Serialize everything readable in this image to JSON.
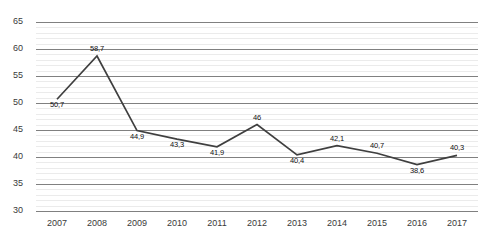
{
  "chart_data": {
    "type": "line",
    "title": "",
    "subtitle": "",
    "xlabel": "",
    "ylabel": "",
    "categories": [
      "2007",
      "2008",
      "2009",
      "2010",
      "2011",
      "2012",
      "2013",
      "2014",
      "2015",
      "2016",
      "2017"
    ],
    "values": [
      50.7,
      58.7,
      44.9,
      43.3,
      41.9,
      46,
      40.4,
      42.1,
      40.7,
      38.6,
      40.3
    ],
    "data_labels": [
      "50,7",
      "58,7",
      "44,9",
      "43,3",
      "41,9",
      "46",
      "40,4",
      "42,1",
      "40,7",
      "38,6",
      "40,3"
    ],
    "ylim": [
      30,
      65
    ],
    "ytick_values": [
      65,
      60,
      55,
      50,
      45,
      40,
      35,
      30
    ],
    "ytick_labels": [
      "65",
      "60",
      "55",
      "50",
      "45",
      "40",
      "35",
      "30"
    ],
    "ytick_step": 5,
    "minor_gridline_step": 1,
    "grid": true,
    "legend": false,
    "legend_position": "none",
    "series": [
      {
        "name": "series-1",
        "color": "#3f3f3f",
        "values": [
          50.7,
          58.7,
          44.9,
          43.3,
          41.9,
          46,
          40.4,
          42.1,
          40.7,
          38.6,
          40.3
        ]
      }
    ],
    "colors": {
      "line": "#3f3f3f",
      "major_gridline": "#808080",
      "minor_gridline": "#ebebeb",
      "background": "#ffffff",
      "axis_text": "#3a3a3a",
      "data_label_text": "#111111"
    },
    "label_offsets": [
      "below",
      "above",
      "below",
      "below",
      "below",
      "above",
      "below",
      "above",
      "above",
      "below",
      "above"
    ]
  }
}
